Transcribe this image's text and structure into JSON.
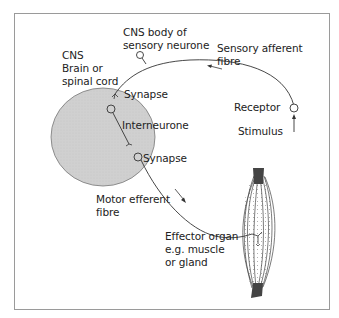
{
  "diagram": {
    "labels": {
      "cns_body_line1": "CNS body of",
      "cns_body_line2": "sensory neurone",
      "cns_line1": "CNS",
      "cns_line2": "Brain or",
      "cns_line3": "spinal cord",
      "sensory_fibre_line1": "Sensory afferent",
      "sensory_fibre_line2": "fibre",
      "synapse_top": "Synapse",
      "interneurone": "Interneurone",
      "synapse_bottom": "Synapse",
      "receptor": "Receptor",
      "stimulus": "Stimulus",
      "motor_fibre_line1": "Motor efferent",
      "motor_fibre_line2": "fibre",
      "effector_line1": "Effector organ",
      "effector_line2": "e.g. muscle",
      "effector_line3": "or gland"
    },
    "colors": {
      "cns_fill": "#d0d0d0",
      "line": "#333333",
      "frame": "#9a9a9a",
      "muscle": "#444444"
    }
  }
}
